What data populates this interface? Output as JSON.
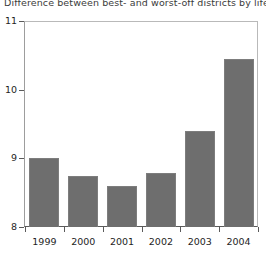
{
  "chart_data": {
    "type": "bar",
    "title": "Difference between best- and worst-off districts by life expec",
    "xlabel": "",
    "ylabel": "",
    "categories": [
      "1999",
      "2000",
      "2001",
      "2002",
      "2003",
      "2004"
    ],
    "values": [
      9.0,
      8.75,
      8.6,
      8.78,
      9.4,
      10.45
    ],
    "ylim": [
      8,
      11
    ],
    "yticks": [
      8,
      9,
      10,
      11
    ],
    "ytick_labels": [
      "8",
      "9",
      "10",
      "11"
    ],
    "grid": false,
    "legend": false,
    "legend_position": "none",
    "series": [
      {
        "name": "Difference in years",
        "values": [
          9.0,
          8.75,
          8.6,
          8.78,
          9.4,
          10.45
        ]
      }
    ],
    "colors": {
      "bar_fill": "#6e6e6e",
      "bar_edge": "#7d7d7d",
      "axis": "#5a5a5a",
      "frame": "#b9b9b9",
      "text": "#1e1e1e",
      "title_text": "#3b3b3b",
      "background": "#ffffff"
    }
  }
}
